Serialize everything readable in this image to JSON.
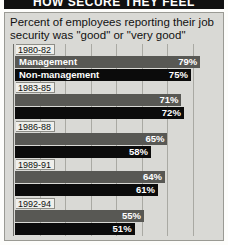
{
  "banner": {
    "headline": "HOW SECURE THEY FEEL"
  },
  "chart_data": {
    "type": "bar",
    "orientation": "horizontal",
    "title": "Percent of employees reporting their job security was \"good\" or \"very good\"",
    "xlabel": "",
    "ylabel": "",
    "xlim": [
      0,
      87
    ],
    "grid": true,
    "gridline_count": 7,
    "legend_position": "inline-first-group",
    "categories": [
      "1980-82",
      "1983-85",
      "1986-88",
      "1989-91",
      "1992-94"
    ],
    "series": [
      {
        "name": "Management",
        "color": "#585854",
        "values": [
          79,
          71,
          65,
          64,
          55
        ],
        "value_labels": [
          "79%",
          "71%",
          "65%",
          "64%",
          "55%"
        ]
      },
      {
        "name": "Non-management",
        "color": "#0b0b0b",
        "values": [
          75,
          72,
          58,
          61,
          51
        ],
        "value_labels": [
          "75%",
          "72%",
          "58%",
          "61%",
          "51%"
        ]
      }
    ],
    "groups": [
      {
        "year": "1980-82",
        "management": {
          "label": "Management",
          "value": 79,
          "value_label": "79%",
          "show_series_label": true
        },
        "non_management": {
          "label": "Non-management",
          "value": 75,
          "value_label": "75%",
          "show_series_label": true
        }
      },
      {
        "year": "1983-85",
        "management": {
          "label": "Management",
          "value": 71,
          "value_label": "71%",
          "show_series_label": false
        },
        "non_management": {
          "label": "Non-management",
          "value": 72,
          "value_label": "72%",
          "show_series_label": false
        }
      },
      {
        "year": "1986-88",
        "management": {
          "label": "Management",
          "value": 65,
          "value_label": "65%",
          "show_series_label": false
        },
        "non_management": {
          "label": "Non-management",
          "value": 58,
          "value_label": "58%",
          "show_series_label": false
        }
      },
      {
        "year": "1989-91",
        "management": {
          "label": "Management",
          "value": 64,
          "value_label": "64%",
          "show_series_label": false
        },
        "non_management": {
          "label": "Non-management",
          "value": 61,
          "value_label": "61%",
          "show_series_label": false
        }
      },
      {
        "year": "1992-94",
        "management": {
          "label": "Management",
          "value": 55,
          "value_label": "55%",
          "show_series_label": false
        },
        "non_management": {
          "label": "Non-management",
          "value": 51,
          "value_label": "51%",
          "show_series_label": false
        }
      }
    ]
  }
}
